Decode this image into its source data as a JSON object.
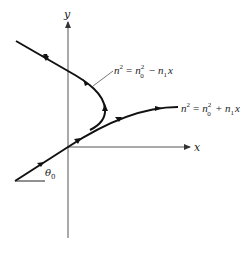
{
  "figure": {
    "axes": {
      "x_label": "x",
      "y_label": "y"
    },
    "curves": [
      {
        "id": "decreasing-index-ray",
        "equation": {
          "lhs": "n",
          "lhs_exp": "2",
          "equals": "=",
          "t1": "n",
          "t1_exp": "2",
          "t1_sub": "0",
          "op": "−",
          "t2": "n",
          "t2_sub": "1",
          "t2_var": "x"
        },
        "description": "ray bends back (turning point) in medium n² = n₀² − n₁x"
      },
      {
        "id": "increasing-index-ray",
        "equation": {
          "lhs": "n",
          "lhs_exp": "2",
          "equals": "=",
          "t1": "n",
          "t1_exp": "2",
          "t1_sub": "0",
          "op": "+",
          "t2": "n",
          "t2_sub": "1",
          "t2_var": "x"
        },
        "description": "ray bends toward horizontal in medium n² = n₀² + n₁x"
      }
    ],
    "angle_label": {
      "symbol": "θ",
      "sub": "0"
    },
    "colors": {
      "ink": "#222222",
      "axis": "#555555",
      "background": "#ffffff"
    }
  }
}
